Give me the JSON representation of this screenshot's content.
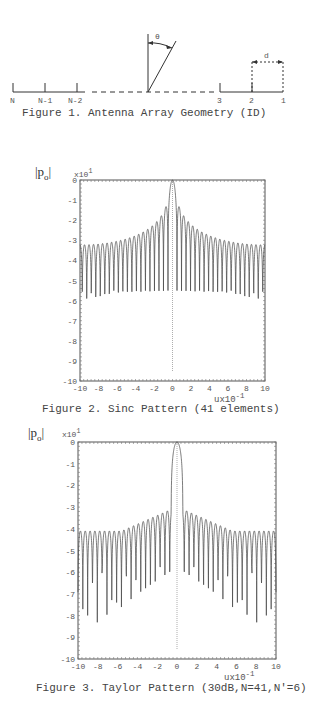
{
  "figure1": {
    "caption": "Figure 1.  Antenna Array Geometry (ID)",
    "element_labels": [
      "N",
      "N-1",
      "N-2",
      "3",
      "2",
      "1"
    ],
    "angle_label": "θ",
    "spacing_label": "d"
  },
  "figure2": {
    "caption": "Figure 2.  Sinc Pattern (41 elements)",
    "ylabel": "|p",
    "ylabel_sub": "o",
    "ylabel_end": "|",
    "y_multiplier": "x10",
    "y_multiplier_exp": "1",
    "xlabel": "u",
    "x_multiplier": "x10",
    "x_multiplier_exp": "-1"
  },
  "figure3": {
    "caption": "Figure 3.  Taylor Pattern (30dB,N=41,N'=6)",
    "ylabel": "|p",
    "ylabel_sub": "o",
    "ylabel_end": "|",
    "y_multiplier": "x10",
    "y_multiplier_exp": "1",
    "xlabel": "u",
    "x_multiplier": "x10",
    "x_multiplier_exp": "-1"
  },
  "chart_data": [
    {
      "type": "line",
      "title": "Figure 2. Sinc Pattern (41 elements)",
      "xlabel": "u x10^-1",
      "ylabel": "|p_o| x10^1 (dB)",
      "xlim": [
        -10,
        10
      ],
      "ylim": [
        -10,
        0
      ],
      "x_ticks": [
        -10,
        -8,
        -6,
        -4,
        -2,
        0,
        2,
        4,
        6,
        8,
        10
      ],
      "y_ticks": [
        0,
        -1,
        -2,
        -3,
        -4,
        -5,
        -6,
        -7,
        -8,
        -9,
        -10
      ],
      "grid": false,
      "series": [
        {
          "name": "sinc pattern",
          "description": "uniform 41-element array factor, main lobe 0 dB at u=0, first sidelobe ~-13 dB, far sidelobes ~-33 dB, nulls down to ~-85 dB"
        }
      ],
      "peak_sidelobe_db": -13.3,
      "far_sidelobe_db": -33
    },
    {
      "type": "line",
      "title": "Figure 3. Taylor Pattern (30dB,N=41,N'=6)",
      "xlabel": "u x10^-1",
      "ylabel": "|p_o| x10^1 (dB)",
      "xlim": [
        -10,
        10
      ],
      "ylim": [
        -10,
        0
      ],
      "x_ticks": [
        -10,
        -8,
        -6,
        -4,
        -2,
        0,
        2,
        4,
        6,
        8,
        10
      ],
      "y_ticks": [
        0,
        -1,
        -2,
        -3,
        -4,
        -5,
        -6,
        -7,
        -8,
        -9,
        -10
      ],
      "grid": false,
      "series": [
        {
          "name": "taylor pattern",
          "description": "30 dB Taylor, N=41, nbar=6; main lobe 0 dB, near sidelobes ~-31 dB, far sidelobes ~-41 dB, nulls down to ~-93 dB"
        }
      ],
      "peak_sidelobe_db": -30,
      "far_sidelobe_db": -41
    }
  ],
  "y_tick_labels": [
    "0",
    "-1",
    "-2",
    "-3",
    "-4",
    "-5",
    "-6",
    "-7",
    "-8",
    "-9",
    "-10"
  ],
  "x_tick_labels": [
    "-10",
    "-8",
    "-6",
    "-4",
    "-2",
    "0",
    "2",
    "4",
    "6",
    "8",
    "10"
  ]
}
